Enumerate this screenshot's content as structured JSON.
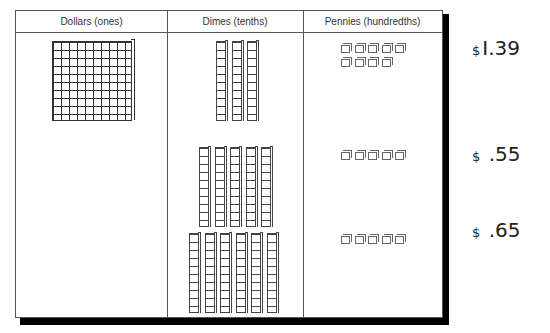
{
  "headers": {
    "dollars": "Dollars (ones)",
    "dimes": "Dimes (tenths)",
    "pennies": "Pennies (hundredths)"
  },
  "rows": [
    {
      "flats": 1,
      "rods": 3,
      "cubes": 9,
      "amount": "1.39",
      "currency": "$"
    },
    {
      "flats": 0,
      "rods": 5,
      "cubes": 5,
      "amount": ".55",
      "currency": "$"
    },
    {
      "flats": 0,
      "rods": 6,
      "cubes": 5,
      "amount": ".65",
      "currency": "$"
    }
  ],
  "amounts": {
    "row1": "I.39",
    "row2": " .55",
    "row3": " .65",
    "currency": "$"
  }
}
